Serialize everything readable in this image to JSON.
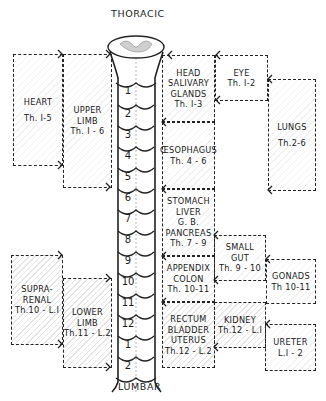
{
  "title_top": "THORACIC",
  "title_bottom": "LUMBAR",
  "spinal_segments": {
    "thoracic": [
      "1",
      "2",
      "3",
      "4",
      "5",
      "6",
      "7",
      "8",
      "9",
      "10",
      "11",
      "12"
    ],
    "lumbar": [
      "1",
      "2"
    ]
  },
  "left_boxes": {
    "heart": {
      "lines": [
        "HEART",
        "Th. I-5"
      ]
    },
    "upper_limb": {
      "lines": [
        "UPPER",
        "LIMB",
        "Th. I - 6"
      ]
    },
    "suprarenal": {
      "lines": [
        "SUPRA-",
        "RENAL",
        "Th.10 - L.I"
      ]
    },
    "lower_limb": {
      "lines": [
        "LOWER",
        "LIMB",
        "Th.11 - L.2"
      ]
    }
  },
  "center_boxes": {
    "head": {
      "lines": [
        "HEAD",
        "SALIVARY",
        "GLANDS",
        "Th. I-3"
      ]
    },
    "oesophagus": {
      "lines": [
        "ŒSOPHAGUS",
        "Th. 4 - 6"
      ]
    },
    "stomach": {
      "lines": [
        "STOMACH",
        "LIVER",
        "G. B.",
        "PANCREAS",
        "Th. 7 - 9"
      ]
    },
    "appendix": {
      "lines": [
        "APPENDIX",
        "COLON",
        "Th. 10-11"
      ]
    },
    "rectum": {
      "lines": [
        "RECTUM",
        "BLADDER",
        "UTERUS",
        "Th.12 - L.2"
      ]
    }
  },
  "right_boxes": {
    "eye": {
      "lines": [
        "EYE",
        "Th. I-2"
      ]
    },
    "lungs": {
      "lines": [
        "LUNGS",
        "Th.2-6"
      ]
    },
    "small_gut": {
      "lines": [
        "SMALL",
        "GUT",
        "Th. 9 - 10"
      ]
    },
    "gonads": {
      "lines": [
        "GONADS",
        "Th 10-11"
      ]
    },
    "kidney": {
      "lines": [
        "KIDNEY",
        "Th.12 - L.I"
      ]
    },
    "ureter": {
      "lines": [
        "URETER",
        "L.I - 2"
      ]
    }
  }
}
